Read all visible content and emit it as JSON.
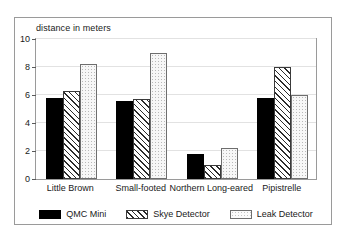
{
  "chart_data": {
    "type": "bar",
    "title": "distance in meters",
    "xlabel": "",
    "ylabel": "",
    "ylim": [
      0,
      10
    ],
    "yticks": [
      0,
      2,
      4,
      6,
      8,
      10
    ],
    "grid": true,
    "legend_position": "bottom",
    "categories": [
      "Little Brown",
      "Small-footed",
      "Northern Long-eared",
      "Pipistrelle"
    ],
    "series": [
      {
        "name": "QMC Mini",
        "values": [
          5.8,
          5.6,
          1.8,
          5.8
        ],
        "fill": "solid-black",
        "color": "#000000"
      },
      {
        "name": "Skye Detector",
        "values": [
          6.3,
          5.7,
          1.0,
          8.0
        ],
        "fill": "diagonal-hatch",
        "color": "#2b2b2b"
      },
      {
        "name": "Leak Detector",
        "values": [
          8.2,
          9.0,
          2.2,
          6.0
        ],
        "fill": "dotted-light",
        "color": "#f7f7f7"
      }
    ]
  },
  "colors": {
    "frame": "#9a9a9a",
    "grid": "#e2e2e2",
    "text": "#1a1a1a",
    "background": "#ffffff"
  }
}
